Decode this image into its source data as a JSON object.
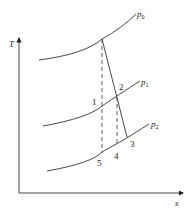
{
  "diagram": {
    "type": "T-s diagram",
    "axes": {
      "y_label": "T",
      "x_label": "s"
    },
    "isobars": [
      {
        "id": "p0",
        "symbol": "p",
        "subscript": "0"
      },
      {
        "id": "p1",
        "symbol": "p",
        "subscript": "1"
      },
      {
        "id": "p2",
        "symbol": "p",
        "subscript": "2"
      }
    ],
    "points": [
      {
        "id": "1",
        "label": "1"
      },
      {
        "id": "2",
        "label": "2"
      },
      {
        "id": "3",
        "label": "3"
      },
      {
        "id": "4",
        "label": "4"
      },
      {
        "id": "5",
        "label": "5"
      }
    ],
    "lines": [
      {
        "id": "actual-expansion",
        "style": "solid",
        "description": "from p0 through 2 to 3"
      },
      {
        "id": "isentropic-0-5",
        "style": "dashed",
        "description": "vertical from p0 through 1 to 5"
      },
      {
        "id": "isentropic-2-4",
        "style": "dashed",
        "description": "vertical from 2 to 4"
      }
    ]
  }
}
